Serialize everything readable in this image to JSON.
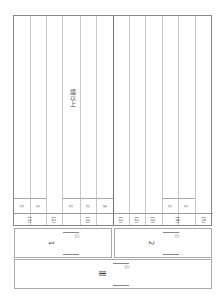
{
  "sheet": {
    "instruction_text": "語以上",
    "left_block": {
      "item_marks": [
        "①",
        "②",
        "",
        "①",
        "②",
        "③"
      ],
      "group_labels": [
        "(1)",
        "(2)",
        "(3)"
      ]
    },
    "right_block": {
      "item_marks": [
        "",
        "",
        "",
        "①",
        "②",
        ""
      ],
      "group_labels": [
        "(1)",
        "(2)",
        "(3)",
        "(4)",
        "(5)"
      ]
    }
  },
  "score_panels": [
    {
      "label": "1",
      "points_mark": "点"
    },
    {
      "label": "2",
      "points_mark": "点"
    },
    {
      "label": "Ⅲ",
      "points_mark": "点"
    }
  ]
}
